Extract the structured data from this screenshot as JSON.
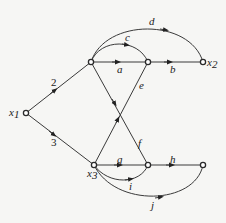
{
  "diagram": {
    "type": "signal-flow-graph",
    "nodes": [
      {
        "id": "x1",
        "label": "x1",
        "x": 26,
        "y": 113
      },
      {
        "id": "n1",
        "label": "",
        "x": 91,
        "y": 62
      },
      {
        "id": "n2",
        "label": "",
        "x": 148,
        "y": 62
      },
      {
        "id": "x2",
        "label": "x2",
        "x": 203,
        "y": 62
      },
      {
        "id": "x3",
        "label": "x3",
        "x": 94,
        "y": 165
      },
      {
        "id": "n4",
        "label": "",
        "x": 148,
        "y": 165
      },
      {
        "id": "n5",
        "label": "",
        "x": 203,
        "y": 165
      }
    ],
    "edges": [
      {
        "from": "x1",
        "to": "n1",
        "gain": "2"
      },
      {
        "from": "x1",
        "to": "x3",
        "gain": "3"
      },
      {
        "from": "n1",
        "to": "n2",
        "gain": "a"
      },
      {
        "from": "n2",
        "to": "x2",
        "gain": "b"
      },
      {
        "from": "n1",
        "to": "n2",
        "gain": "c"
      },
      {
        "from": "n1",
        "to": "x2",
        "gain": "d"
      },
      {
        "from": "x3",
        "to": "n2",
        "gain": "e"
      },
      {
        "from": "n1",
        "to": "n4",
        "gain": "f"
      },
      {
        "from": "x3",
        "to": "n4",
        "gain": "g"
      },
      {
        "from": "n4",
        "to": "n5",
        "gain": "h"
      },
      {
        "from": "x3",
        "to": "n4",
        "gain": "i"
      },
      {
        "from": "x3",
        "to": "n5",
        "gain": "j"
      }
    ]
  },
  "labels": {
    "x1": "x",
    "x1_sub": "1",
    "x2": "x",
    "x2_sub": "2",
    "x3": "x",
    "x3_sub": "3",
    "g2": "2",
    "g3": "3",
    "a": "a",
    "b": "b",
    "c": "c",
    "d": "d",
    "e": "e",
    "f": "f",
    "g": "g",
    "h": "h",
    "i": "i",
    "j": "j"
  }
}
